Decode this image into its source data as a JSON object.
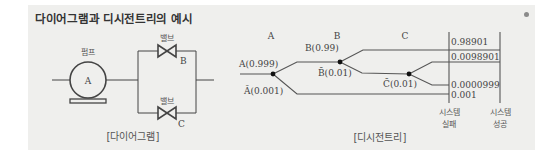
{
  "title": "다이어그램과 디시전트리의 예시",
  "diagram": {
    "pump_label": "펌프",
    "pump_letter": "A",
    "valve_top_label": "밸브",
    "valve_top_letter": "B",
    "valve_bottom_label": "밸브",
    "valve_bottom_letter": "C",
    "caption": "[다이어그램]"
  },
  "decision_tree": {
    "columns": [
      "A",
      "B",
      "C"
    ],
    "branches": {
      "a_success": "A(0.999)",
      "a_fail": "Ā(0.001)",
      "b_success": "B(0.99)",
      "b_fail": "B̄(0.01)",
      "c_fail": "C̄(0.01)"
    },
    "outcomes": [
      "0.98901",
      "0.0098901",
      "0.0000999",
      "0.001"
    ],
    "system_fail": [
      "시스템",
      "실패"
    ],
    "system_success": [
      "시스템",
      "성공"
    ],
    "caption": "[디시전트리]"
  }
}
